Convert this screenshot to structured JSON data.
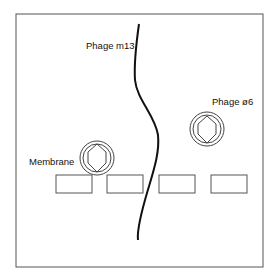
{
  "diagram": {
    "labels": {
      "phage_m13": "Phage m13",
      "phage_phi6": "Phage ø6",
      "membrane": "Membrane"
    },
    "colors": {
      "stroke": "#444444",
      "filament": "#111111",
      "background": "#ffffff"
    }
  }
}
